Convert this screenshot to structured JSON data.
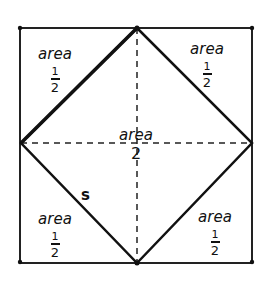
{
  "diagram": {
    "title": "",
    "shapes": {
      "outer_square": {
        "x1": 20,
        "y1": 28,
        "x2": 252,
        "y2": 262
      },
      "inner_diamond": {
        "top": [
          137,
          28
        ],
        "right": [
          252,
          143
        ],
        "bottom": [
          137,
          263
        ],
        "left": [
          21,
          143
        ]
      }
    },
    "labels": {
      "top_left": {
        "word": "area",
        "num": "1",
        "den": "2"
      },
      "top_right": {
        "word": "area",
        "num": "1",
        "den": "2"
      },
      "bottom_left": {
        "word": "area",
        "num": "1",
        "den": "2"
      },
      "bottom_right": {
        "word": "area",
        "num": "1",
        "den": "2"
      },
      "center": {
        "word": "area",
        "value": "2"
      },
      "side": "s"
    },
    "colors": {
      "stroke": "#111111",
      "background": "#ffffff"
    }
  }
}
